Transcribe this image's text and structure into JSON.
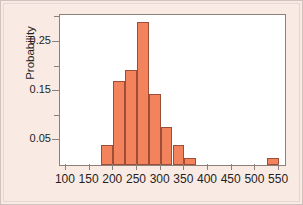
{
  "chart_data": {
    "type": "bar",
    "title": "",
    "subtitle": "",
    "xlabel": "",
    "ylabel": "Probability",
    "xlim": [
      87.5,
      562.5
    ],
    "ylim": [
      0,
      0.305
    ],
    "grid": false,
    "legend": null,
    "bin_width": 25,
    "x_ticks": [
      100,
      150,
      200,
      250,
      300,
      350,
      400,
      450,
      500,
      550
    ],
    "x_tick_labels": [
      "100",
      "150",
      "200",
      "250",
      "300",
      "350",
      "400",
      "450",
      "500",
      "550"
    ],
    "y_ticks": [
      0.05,
      0.1,
      0.15,
      0.2,
      0.25,
      0.3
    ],
    "y_tick_labels": [
      "0.05",
      "",
      "0.15",
      "",
      "0.25",
      ""
    ],
    "y_major_ticks": [
      0.05,
      0.15,
      0.25
    ],
    "y_major_tick_labels": [
      "0.05",
      "0.15",
      "0.25"
    ],
    "y_minor_ticks": [
      0.1,
      0.2,
      0.3
    ],
    "bin_edges": [
      175,
      200,
      225,
      250,
      275,
      300,
      325,
      350,
      375,
      525,
      550
    ],
    "categories": [
      "175-200",
      "200-225",
      "225-250",
      "250-275",
      "275-300",
      "300-325",
      "325-350",
      "350-375",
      "525-550"
    ],
    "bins": [
      {
        "start": 175,
        "end": 200,
        "value": 0.04
      },
      {
        "start": 200,
        "end": 225,
        "value": 0.17
      },
      {
        "start": 225,
        "end": 250,
        "value": 0.193
      },
      {
        "start": 250,
        "end": 275,
        "value": 0.29
      },
      {
        "start": 275,
        "end": 300,
        "value": 0.145
      },
      {
        "start": 300,
        "end": 325,
        "value": 0.077
      },
      {
        "start": 325,
        "end": 350,
        "value": 0.04
      },
      {
        "start": 350,
        "end": 375,
        "value": 0.015
      },
      {
        "start": 525,
        "end": 550,
        "value": 0.015
      }
    ],
    "values": [
      0.04,
      0.17,
      0.193,
      0.29,
      0.145,
      0.077,
      0.04,
      0.015,
      0.015
    ],
    "bar_color": "#f2835c",
    "bar_edge_color": "#9e4d36",
    "plot_background": "#ffffff",
    "figure_background": "#faeae4",
    "axis_color": "#8e8079"
  }
}
